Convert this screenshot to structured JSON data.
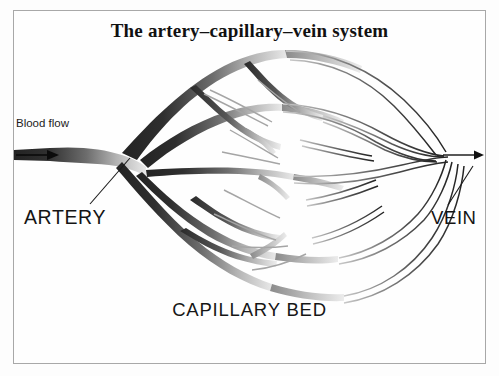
{
  "figure": {
    "title": "The artery–capillary–vein system",
    "type": "anatomical-diagram",
    "background_color": "#fdfdfd",
    "frame_color": "#a8a8a8"
  },
  "labels": {
    "blood_flow": "Blood flow",
    "artery": "ARTERY",
    "vein": "VEIN",
    "capillary_bed": "CAPILLARY BED"
  },
  "colors": {
    "artery_dark": "#2e2e2e",
    "artery_mid": "#4a4a4a",
    "capillary_gray": "#9a9a9a",
    "vein_outline": "#3a3a3a",
    "vein_fill": "#ffffff",
    "text": "#141414"
  },
  "annotations": {
    "inlet_arrow_direction": "right",
    "outlet_arrow_direction": "right",
    "artery_leader_from": "90,204",
    "artery_leader_to": "130,158",
    "vein_leader_from": "448,205",
    "vein_leader_to": "473,166"
  }
}
